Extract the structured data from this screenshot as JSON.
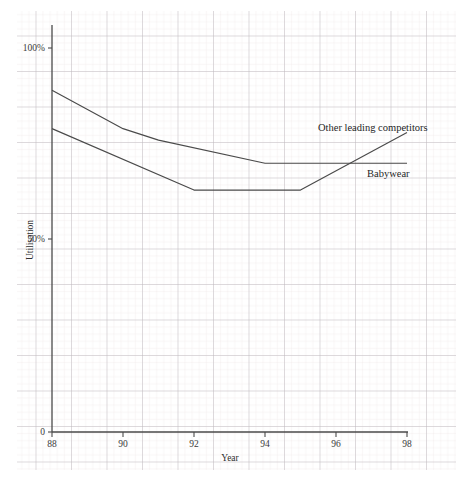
{
  "page": {
    "background_color": "#ffffff",
    "paper_grid": {
      "minor_color": "#ece6e6",
      "major_color": "#b9b4bb",
      "minor_step_px": 7.1,
      "major_step_px": 35.5
    }
  },
  "chart_data": {
    "type": "line",
    "title": "",
    "subtitle": "",
    "xlabel": "Year",
    "ylabel": "Utilisation",
    "x": [
      88,
      90,
      92,
      94,
      96,
      98
    ],
    "xtick_labels": [
      "88",
      "90",
      "92",
      "94",
      "96",
      "98"
    ],
    "ytick_labels": [
      "0",
      "50%",
      "100%"
    ],
    "ytick_values": [
      0,
      50,
      100
    ],
    "xlim": [
      88,
      98
    ],
    "ylim": [
      0,
      100
    ],
    "grid": true,
    "legend_position": "inline-right",
    "series": [
      {
        "name": "Other leading competitors",
        "color": "#4a4a4a",
        "label_x": 96.0,
        "label_y": 84.0,
        "x": [
          88,
          90,
          91,
          94,
          95,
          98
        ],
        "values": [
          89,
          79,
          76,
          70,
          70,
          70
        ]
      },
      {
        "name": "Babywear",
        "color": "#4a4a4a",
        "label_x": 96.6,
        "label_y": 71.5,
        "x": [
          88,
          92,
          95,
          98
        ],
        "values": [
          79,
          63,
          63,
          78
        ]
      }
    ],
    "annotations": [
      {
        "text": "Other leading competitors",
        "series": "Other leading competitors"
      },
      {
        "text": "Babywear",
        "series": "Babywear"
      }
    ],
    "axis_color": "#4a4a4a"
  },
  "axes": {
    "y_axis_name": "utilisation-axis",
    "x_axis_name": "year-axis",
    "y_label": "Utilisation",
    "x_label": "Year",
    "y_ticks": [
      {
        "label": "0",
        "value": 0
      },
      {
        "label": "50%",
        "value": 50
      },
      {
        "label": "100%",
        "value": 100
      }
    ],
    "x_ticks": [
      {
        "label": "88",
        "value": 88
      },
      {
        "label": "90",
        "value": 90
      },
      {
        "label": "92",
        "value": 92
      },
      {
        "label": "94",
        "value": 94
      },
      {
        "label": "96",
        "value": 96
      },
      {
        "label": "98",
        "value": 98
      }
    ]
  },
  "series_labels": {
    "competitors": "Other leading competitors",
    "babywear": "Babywear"
  }
}
